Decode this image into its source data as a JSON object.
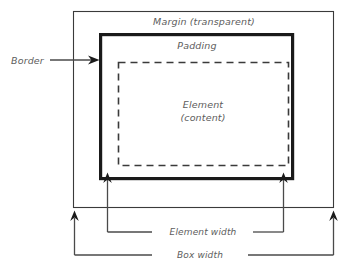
{
  "diagram": {
    "type": "box-model-diagram",
    "background_color": "#ffffff",
    "line_color": "#3a3a3a",
    "border_color": "#1a1a1a",
    "text_color": "#5d5d5d",
    "labels": {
      "margin": "Margin (transparent)",
      "padding": "Padding",
      "element_line1": "Element",
      "element_line2": "(content)",
      "border": "Border",
      "element_width": "Element width",
      "box_width": "Box width"
    },
    "boxes": {
      "margin_box": {
        "x": 73,
        "y": 11,
        "width": 261,
        "height": 197,
        "style": "thin-solid"
      },
      "border_box": {
        "x": 99,
        "y": 33,
        "width": 195,
        "height": 147,
        "style": "thick-solid"
      },
      "content_box": {
        "x": 118,
        "y": 62,
        "width": 171,
        "height": 104,
        "style": "dashed"
      }
    },
    "measurements": [
      {
        "name": "element_width",
        "from_x": 107,
        "to_x": 283,
        "at_y": 180,
        "label_y": 232
      },
      {
        "name": "box_width",
        "from_x": 74,
        "to_x": 333,
        "at_y": 218,
        "label_y": 255
      }
    ]
  }
}
